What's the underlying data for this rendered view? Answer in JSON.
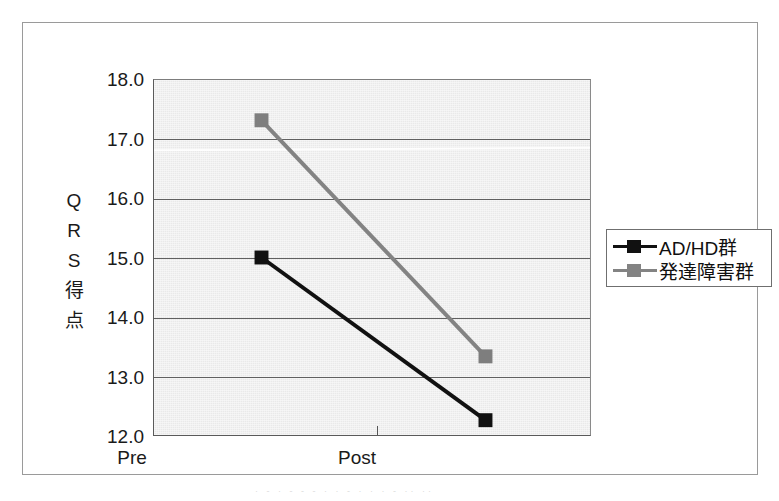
{
  "chart_data": {
    "type": "line",
    "title": "",
    "xlabel": "",
    "ylabel": "QRS得点",
    "ylabel_chars": [
      "Q",
      "R",
      "S",
      "得",
      "点"
    ],
    "categories": [
      "Pre",
      "Post"
    ],
    "ylim": [
      12.0,
      18.0
    ],
    "ytick_labels": [
      "18.0",
      "17.0",
      "16.0",
      "15.0",
      "14.0",
      "13.0",
      "12.0"
    ],
    "ytick_values": [
      18.0,
      17.0,
      16.0,
      15.0,
      14.0,
      13.0,
      12.0
    ],
    "grid": true,
    "grid_axis": "y",
    "legend_position": "right",
    "series": [
      {
        "name": "AD/HD群",
        "values": [
          15.0,
          12.25
        ],
        "color": "#111111",
        "marker": "square",
        "marker_color": "#111111"
      },
      {
        "name": "発達障害群",
        "values": [
          17.32,
          13.33
        ],
        "color": "#838383",
        "marker": "square",
        "marker_color": "#7e7e7e"
      }
    ]
  },
  "figure": {
    "plot_background": "#e9e9e9",
    "frame_color": "#9a9a9a",
    "axis_color": "#5a5a5a",
    "gridline_color": "#606060",
    "text_color": "#1a1a1a"
  },
  "legend": {
    "items": [
      {
        "label": "AD/HD群",
        "color": "#111111"
      },
      {
        "label": "発達障害群",
        "color": "#838383"
      }
    ]
  },
  "artifact": {
    "scan_text": "· - ·   - - -    · ·   - ·  ·  · -   ·· ··"
  }
}
